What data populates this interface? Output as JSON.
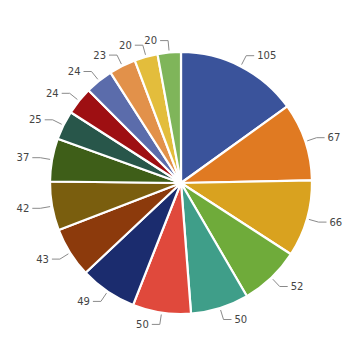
{
  "chart_data": {
    "type": "pie",
    "title": "",
    "start_angle_deg": 0,
    "direction": "clockwise",
    "categories": [
      "S1",
      "S2",
      "S3",
      "S4",
      "S5",
      "S6",
      "S7",
      "S8",
      "S9",
      "S10",
      "S11",
      "S12",
      "S13",
      "S14",
      "S15",
      "S16"
    ],
    "values": [
      105,
      67,
      66,
      52,
      50,
      50,
      49,
      43,
      42,
      37,
      25,
      24,
      24,
      23,
      20,
      20
    ],
    "labels": [
      "105",
      "67",
      "66",
      "52",
      "50",
      "50",
      "49",
      "43",
      "42",
      "37",
      "25",
      "24",
      "24",
      "23",
      "20",
      "20"
    ],
    "colors": [
      "#3a539b",
      "#e07a22",
      "#d9a21f",
      "#6fab3a",
      "#3f9e89",
      "#e0493c",
      "#1b2c6e",
      "#8c3a0c",
      "#7a5e0e",
      "#3e5e18",
      "#28564a",
      "#9e0f12",
      "#5b6cab",
      "#e2914a",
      "#e3bd3c",
      "#7fb55a"
    ],
    "legend": null,
    "data_labels": "outside with leader lines"
  }
}
